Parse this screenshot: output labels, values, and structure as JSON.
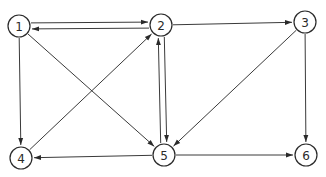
{
  "diagram": {
    "type": "directed-graph",
    "colors": {
      "stroke": "#2a2a2a",
      "background": "#ffffff"
    },
    "node_radius": 11,
    "nodes": [
      {
        "id": "1",
        "label": "1",
        "x": 19,
        "y": 26
      },
      {
        "id": "2",
        "label": "2",
        "x": 161,
        "y": 25
      },
      {
        "id": "3",
        "label": "3",
        "x": 305,
        "y": 22
      },
      {
        "id": "4",
        "label": "4",
        "x": 21,
        "y": 158
      },
      {
        "id": "5",
        "label": "5",
        "x": 164,
        "y": 155
      },
      {
        "id": "6",
        "label": "6",
        "x": 306,
        "y": 155
      }
    ],
    "edges": [
      {
        "from": "2",
        "to": "1",
        "offset": -3
      },
      {
        "from": "1",
        "to": "2",
        "offset": -3
      },
      {
        "from": "2",
        "to": "3",
        "offset": 0
      },
      {
        "from": "1",
        "to": "4",
        "offset": 0
      },
      {
        "from": "1",
        "to": "5",
        "offset": 0
      },
      {
        "from": "4",
        "to": "2",
        "offset": 0
      },
      {
        "from": "2",
        "to": "5",
        "offset": -3
      },
      {
        "from": "5",
        "to": "2",
        "offset": -3
      },
      {
        "from": "3",
        "to": "5",
        "offset": 0
      },
      {
        "from": "3",
        "to": "6",
        "offset": 0
      },
      {
        "from": "5",
        "to": "4",
        "offset": 0
      },
      {
        "from": "5",
        "to": "6",
        "offset": 0
      }
    ]
  }
}
